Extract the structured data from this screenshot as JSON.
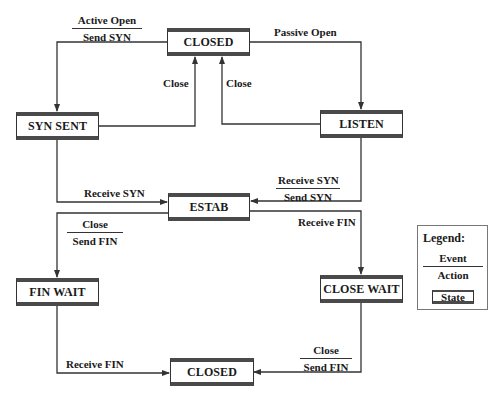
{
  "diagram": {
    "type": "state-transition",
    "colors": {
      "line": "#333333",
      "state_bar": "#4a4a4a",
      "background": "#ffffff"
    },
    "states": [
      {
        "id": "closed_top",
        "label": "CLOSED"
      },
      {
        "id": "syn_sent",
        "label": "SYN SENT"
      },
      {
        "id": "listen",
        "label": "LISTEN"
      },
      {
        "id": "estab",
        "label": "ESTAB"
      },
      {
        "id": "fin_wait",
        "label": "FIN WAIT"
      },
      {
        "id": "close_wait",
        "label": "CLOSE WAIT"
      },
      {
        "id": "closed_bottom",
        "label": "CLOSED"
      }
    ],
    "transitions": [
      {
        "from": "closed_top",
        "to": "syn_sent",
        "event": "Active Open",
        "action": "Send SYN"
      },
      {
        "from": "closed_top",
        "to": "listen",
        "event": "Passive Open",
        "action": ""
      },
      {
        "from": "syn_sent",
        "to": "closed_top",
        "event": "Close",
        "action": ""
      },
      {
        "from": "listen",
        "to": "closed_top",
        "event": "Close",
        "action": ""
      },
      {
        "from": "syn_sent",
        "to": "estab",
        "event": "Receive SYN",
        "action": ""
      },
      {
        "from": "listen",
        "to": "estab",
        "event": "Receive SYN",
        "action": "Send SYN"
      },
      {
        "from": "estab",
        "to": "fin_wait",
        "event": "Close",
        "action": "Send FIN"
      },
      {
        "from": "estab",
        "to": "close_wait",
        "event": "Receive FIN",
        "action": ""
      },
      {
        "from": "fin_wait",
        "to": "closed_bottom",
        "event": "Receive FIN",
        "action": ""
      },
      {
        "from": "close_wait",
        "to": "closed_bottom",
        "event": "Close",
        "action": "Send FIN"
      }
    ],
    "legend": {
      "title": "Legend:",
      "event": "Event",
      "action": "Action",
      "state": "State"
    }
  }
}
